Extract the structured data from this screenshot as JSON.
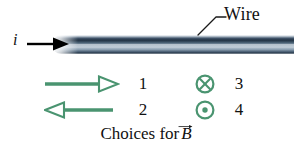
{
  "figure": {
    "background_color": "#ffffff"
  },
  "wire": {
    "label": "Wire",
    "leader_icon": "leader-line",
    "color_top": "#213243",
    "color_mid": "#b9c7d3",
    "color_bottom": "#233445"
  },
  "current": {
    "symbol": "i",
    "arrow_icon": "right-arrow-solid-black",
    "arrow_color": "#000000"
  },
  "choices": {
    "caption_prefix": "Choices for",
    "caption_vector": "B",
    "accent_color": "#4a9470",
    "items": [
      {
        "number": "1",
        "glyph": "arrow-right-hollow-green",
        "direction": "right"
      },
      {
        "number": "3",
        "glyph": "circle-cross-green",
        "direction": "into-page"
      },
      {
        "number": "2",
        "glyph": "arrow-left-hollow-green",
        "direction": "left"
      },
      {
        "number": "4",
        "glyph": "circle-dot-green",
        "direction": "out-of-page"
      }
    ]
  }
}
